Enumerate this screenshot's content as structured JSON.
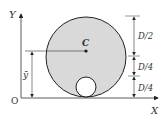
{
  "diagram": {
    "axis_labels": {
      "y": "Y",
      "x": "X",
      "origin": "O"
    },
    "centroid_label": "C",
    "ybar_label": "ȳ",
    "dimensions": [
      {
        "label": "D/2"
      },
      {
        "label": "D/4"
      },
      {
        "label": "D/4"
      }
    ],
    "colors": {
      "fill": "#d9d9d9",
      "stroke": "#222222",
      "background": "#ffffff"
    }
  }
}
